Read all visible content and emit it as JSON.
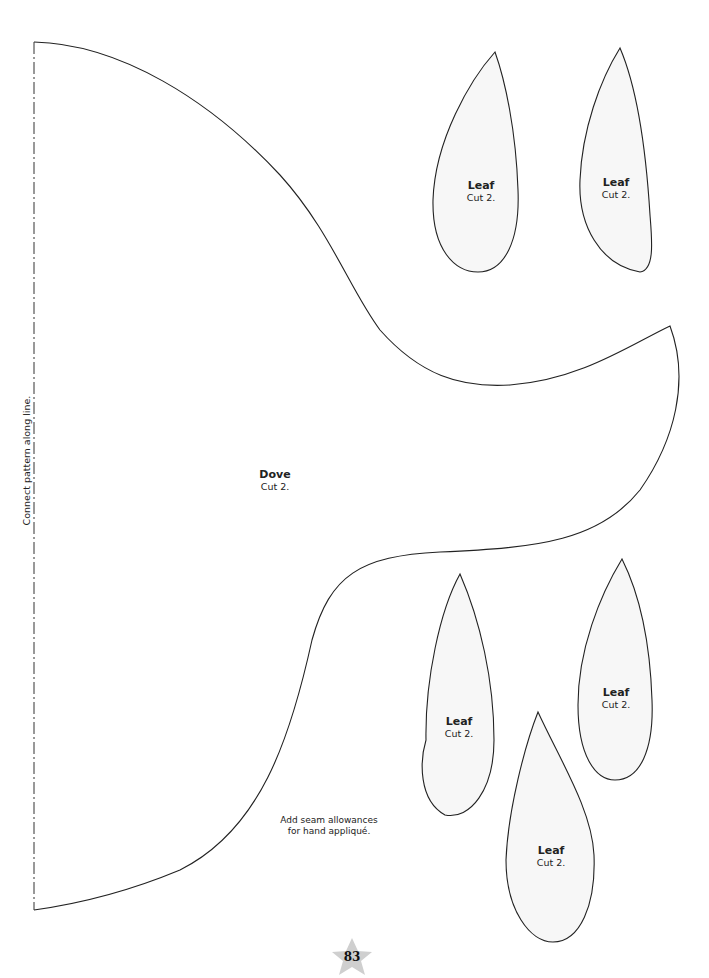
{
  "page": {
    "number": "83",
    "star_color": "#cfcfcf",
    "line_color": "#222222",
    "leaf_fill": "#f7f7f7"
  },
  "fold_line": {
    "label": "Connect pattern along line."
  },
  "dove": {
    "title": "Dove",
    "instruction": "Cut 2."
  },
  "note": {
    "line1": "Add seam allowances",
    "line2": "for hand appliqué."
  },
  "leaves": [
    {
      "title": "Leaf",
      "instruction": "Cut 2."
    },
    {
      "title": "Leaf",
      "instruction": "Cut 2."
    },
    {
      "title": "Leaf",
      "instruction": "Cut 2."
    },
    {
      "title": "Leaf",
      "instruction": "Cut 2."
    },
    {
      "title": "Leaf",
      "instruction": "Cut 2."
    }
  ]
}
